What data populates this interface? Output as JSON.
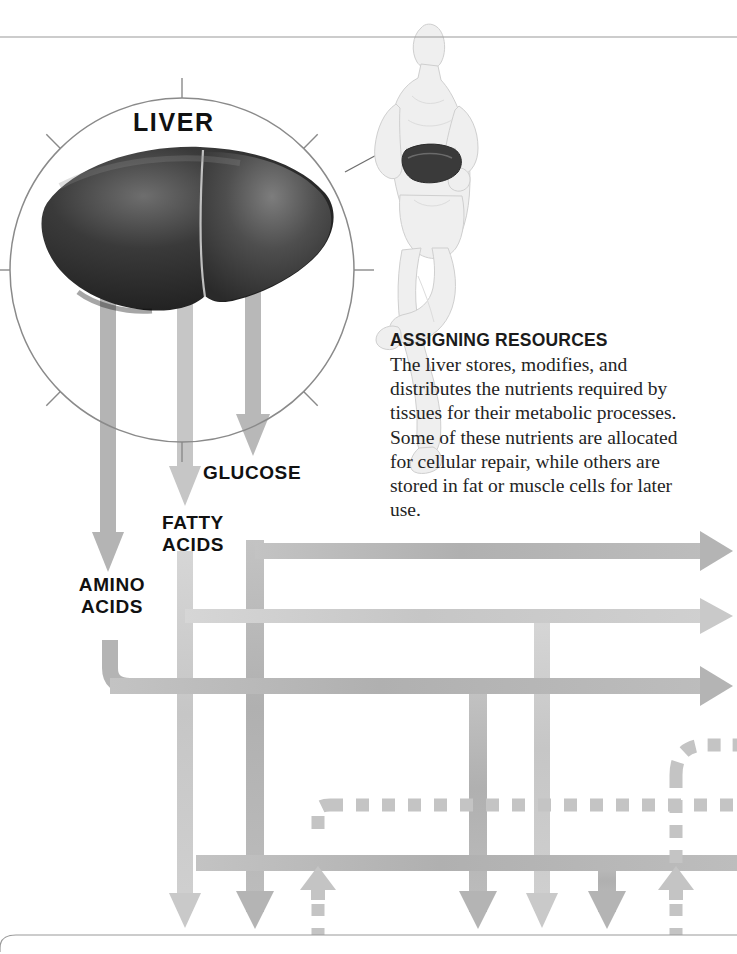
{
  "page": {
    "width": 737,
    "height": 954,
    "background": "#ffffff",
    "top_rule_y": 37,
    "bottom_rule_y": 935
  },
  "magnifier": {
    "label": "LIVER",
    "center_x": 182,
    "center_y": 270,
    "radius": 172,
    "stroke": "#8a8a8a",
    "tick_count": 8,
    "tick_length": 14,
    "organ_name": "liver-illustration",
    "organ_fill_dark": "#2b2b2b",
    "organ_fill_mid": "#565656"
  },
  "body_figure": {
    "name": "running-human-figure",
    "highlight_organ": "liver",
    "body_fill": "#efefef",
    "body_stroke": "#cfcfcf",
    "organ_highlight": "#3a3a3a",
    "leader_line_from_x": 345,
    "leader_line_from_y": 172,
    "leader_line_to_x": 432,
    "leader_line_to_y": 122
  },
  "callout": {
    "heading": "ASSIGNING RESOURCES",
    "body": "The liver stores, modifies, and distributes the nutrients required by tissues for their metabolic processes. Some of these nutrients are allocated for cellular repair, while others are stored in fat or muscle cells for later use."
  },
  "nutrients": [
    {
      "id": "glucose",
      "label": "GLUCOSE",
      "arrow_x": 253,
      "arrow_top": 210,
      "arrow_tip_y": 462,
      "color": "#b8b8b8"
    },
    {
      "id": "fatty-acids",
      "label": "FATTY\nACIDS",
      "arrow_x": 185,
      "arrow_top": 250,
      "arrow_tip_y": 512,
      "color": "#c6c6c6"
    },
    {
      "id": "amino-acids",
      "label": "AMINO\nACIDS",
      "arrow_x": 108,
      "arrow_top": 280,
      "arrow_tip_y": 574,
      "color": "#b0b0b0"
    }
  ],
  "colors": {
    "pipe_dark": "#b4b4b4",
    "pipe_light": "#c9c9c9",
    "pipe_mid": "#bdbdbd",
    "dashed": "#c4c4c4",
    "rule": "#9a9a9a",
    "text": "#111111"
  },
  "pipes": {
    "horizontal_outputs": [
      {
        "id": "output-top",
        "y": 551,
        "x_start": 255,
        "x_end": 728,
        "color": "#b4b4b4",
        "arrow": "right"
      },
      {
        "id": "output-middle",
        "y": 616,
        "x_start": 185,
        "x_end": 728,
        "color": "#c9c9c9",
        "arrow": "right"
      },
      {
        "id": "output-bottom",
        "y": 686,
        "x_start": 110,
        "x_end": 728,
        "color": "#b4b4b4",
        "arrow": "right"
      }
    ],
    "horizontal_return": {
      "id": "return-bus",
      "y": 863,
      "x_start": 196,
      "x_end": 737,
      "color": "#b4b4b4"
    },
    "verticals": [
      {
        "id": "vert-amino",
        "x": 185,
        "y_start": 551,
        "y_end": 935,
        "color": "#c9c9c9",
        "arrow": "down"
      },
      {
        "id": "vert-fatty",
        "x": 255,
        "y_start": 540,
        "y_end": 935,
        "color": "#b4b4b4",
        "arrow": "down"
      },
      {
        "id": "vert-glucose",
        "x": 478,
        "y_start": 686,
        "y_end": 935,
        "color": "#b4b4b4",
        "arrow": "down"
      },
      {
        "id": "vert-mid",
        "x": 542,
        "y_start": 616,
        "y_end": 935,
        "color": "#c9c9c9",
        "arrow": "down"
      },
      {
        "id": "vert-right",
        "x": 607,
        "y_start": 863,
        "y_end": 935,
        "color": "#b4b4b4",
        "arrow": "down"
      }
    ],
    "elbow_amino": {
      "from_x": 110,
      "from_y": 640,
      "to_y": 686,
      "radius": 24
    }
  },
  "dashed_paths": [
    {
      "id": "dashed-return-horizontal",
      "y": 805,
      "x_start": 318,
      "x_end": 737,
      "color": "#c4c4c4"
    },
    {
      "id": "dashed-riser-left",
      "x": 318,
      "y_start": 805,
      "y_end": 863,
      "color": "#c4c4c4"
    },
    {
      "id": "dashed-riser-right",
      "x": 676,
      "y_start": 745,
      "y_end": 935,
      "color": "#c4c4c4"
    },
    {
      "id": "dashed-elbow-right",
      "x": 676,
      "y": 745,
      "x_end": 737,
      "color": "#c4c4c4"
    }
  ],
  "bottom_arrows": [
    {
      "id": "down-arrow-amino",
      "x": 185,
      "style": "solid",
      "direction": "down",
      "color": "#c9c9c9"
    },
    {
      "id": "down-arrow-fatty",
      "x": 255,
      "style": "solid",
      "direction": "down",
      "color": "#b4b4b4"
    },
    {
      "id": "up-arrow-left",
      "x": 318,
      "style": "dashed",
      "direction": "up",
      "color": "#c4c4c4"
    },
    {
      "id": "down-arrow-glucose",
      "x": 478,
      "style": "solid",
      "direction": "down",
      "color": "#b4b4b4"
    },
    {
      "id": "down-arrow-mid",
      "x": 542,
      "style": "solid",
      "direction": "down",
      "color": "#c9c9c9"
    },
    {
      "id": "down-arrow-right",
      "x": 607,
      "style": "solid",
      "direction": "down",
      "color": "#b4b4b4"
    },
    {
      "id": "up-arrow-right",
      "x": 676,
      "style": "dashed",
      "direction": "up",
      "color": "#c4c4c4"
    }
  ]
}
